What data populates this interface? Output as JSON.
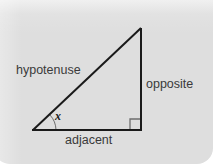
{
  "diagram": {
    "kind": "right-triangle-trigonometry",
    "title": "",
    "panel_color": "#dedede",
    "stroke_color": "#1a1a1a",
    "label_color": "#3a3a3a",
    "labels": {
      "hypotenuse": "hypotenuse",
      "opposite": "opposite",
      "adjacent": "adjacent",
      "angle": "x"
    },
    "markers": {
      "right_angle": "right-angle-square",
      "angle_arc": "angle-arc"
    },
    "vertices": {
      "apex": [
        141,
        28
      ],
      "bottom_left": [
        33,
        130
      ],
      "bottom_right": [
        141,
        130
      ]
    }
  }
}
